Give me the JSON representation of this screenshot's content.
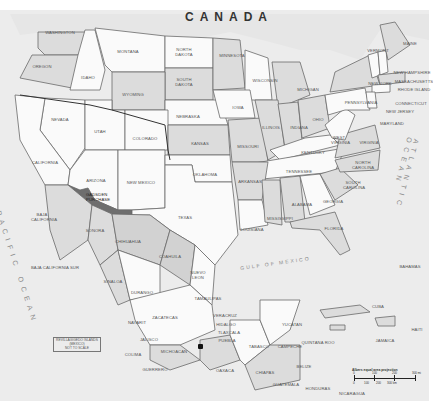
{
  "map": {
    "title_country": "CANADA",
    "highlighted_region": "Gadsden Purchase",
    "oceans": {
      "pacific": "PACIFIC OCEAN",
      "atlantic": "ATLANTIC OCEAN",
      "gulf": "GULF OF MEXICO"
    },
    "us_states": [
      {
        "id": "washington",
        "label": "WASHINGTON"
      },
      {
        "id": "oregon",
        "label": "OREGON"
      },
      {
        "id": "idaho",
        "label": "IDAHO"
      },
      {
        "id": "montana",
        "label": "MONTANA"
      },
      {
        "id": "north-dakota",
        "label": "NORTH DAKOTA"
      },
      {
        "id": "south-dakota",
        "label": "SOUTH DAKOTA"
      },
      {
        "id": "minnesota",
        "label": "MINNESOTA"
      },
      {
        "id": "wisconsin",
        "label": "WISCONSIN"
      },
      {
        "id": "michigan",
        "label": "MICHIGAN"
      },
      {
        "id": "wyoming",
        "label": "WYOMING"
      },
      {
        "id": "nebraska",
        "label": "NEBRASKA"
      },
      {
        "id": "iowa",
        "label": "IOWA"
      },
      {
        "id": "nevada",
        "label": "NEVADA"
      },
      {
        "id": "utah",
        "label": "UTAH"
      },
      {
        "id": "colorado",
        "label": "COLORADO"
      },
      {
        "id": "kansas",
        "label": "KANSAS"
      },
      {
        "id": "california",
        "label": "CALIFORNIA"
      },
      {
        "id": "arizona",
        "label": "ARIZONA"
      },
      {
        "id": "new-mexico",
        "label": "NEW MEXICO"
      },
      {
        "id": "oklahoma",
        "label": "OKLAHOMA"
      },
      {
        "id": "texas",
        "label": "TEXAS"
      },
      {
        "id": "missouri",
        "label": "MISSOURI"
      },
      {
        "id": "illinois",
        "label": "ILLINOIS"
      },
      {
        "id": "indiana",
        "label": "INDIANA"
      },
      {
        "id": "ohio",
        "label": "OHIO"
      },
      {
        "id": "kentucky",
        "label": "KENTUCKY"
      },
      {
        "id": "tennessee",
        "label": "TENNESSEE"
      },
      {
        "id": "arkansas",
        "label": "ARKANSAS"
      },
      {
        "id": "louisiana",
        "label": "LOUISIANA"
      },
      {
        "id": "mississippi",
        "label": "MISSISSIPPI"
      },
      {
        "id": "alabama",
        "label": "ALABAMA"
      },
      {
        "id": "georgia",
        "label": "GEORGIA"
      },
      {
        "id": "florida",
        "label": "FLORIDA"
      },
      {
        "id": "south-carolina",
        "label": "SOUTH CAROLINA"
      },
      {
        "id": "north-carolina",
        "label": "NORTH CAROLINA"
      },
      {
        "id": "virginia",
        "label": "VIRGINIA"
      },
      {
        "id": "west-virginia",
        "label": "WEST VIRGINIA"
      },
      {
        "id": "pennsylvania",
        "label": "PENNSYLVANIA"
      },
      {
        "id": "new-york",
        "label": "NEW YORK"
      },
      {
        "id": "vermont",
        "label": "VERMONT"
      },
      {
        "id": "new-hampshire",
        "label": "NEW HAMPSHIRE"
      },
      {
        "id": "maine",
        "label": "MAINE"
      },
      {
        "id": "massachusetts",
        "label": "MASSACHUSETTS"
      },
      {
        "id": "rhode-island",
        "label": "RHODE ISLAND"
      },
      {
        "id": "connecticut",
        "label": "CONNECTICUT"
      },
      {
        "id": "new-jersey",
        "label": "NEW JERSEY"
      },
      {
        "id": "maryland",
        "label": "MARYLAND"
      },
      {
        "id": "gadsden",
        "label": "GADSDEN PURCHASE"
      }
    ],
    "mexico_states": [
      {
        "id": "baja-california",
        "label": "BAJA CALIFORNIA"
      },
      {
        "id": "baja-california-sur",
        "label": "BAJA CALIFORNIA SUR"
      },
      {
        "id": "sonora",
        "label": "SONORA"
      },
      {
        "id": "chihuahua",
        "label": "CHIHUAHUA"
      },
      {
        "id": "coahuila",
        "label": "COAHUILA"
      },
      {
        "id": "nuevo-leon",
        "label": "NUEVO LEON"
      },
      {
        "id": "sinaloa",
        "label": "SINALOA"
      },
      {
        "id": "durango",
        "label": "DURANGO"
      },
      {
        "id": "tamaulipas",
        "label": "TAMAULIPAS"
      },
      {
        "id": "zacatecas",
        "label": "ZACATECAS"
      },
      {
        "id": "nayarit",
        "label": "NAYARIT"
      },
      {
        "id": "jalisco",
        "label": "JALISCO"
      },
      {
        "id": "colima",
        "label": "COLIMA"
      },
      {
        "id": "michoacan",
        "label": "MICHOACAN"
      },
      {
        "id": "guerrero",
        "label": "GUERRERO"
      },
      {
        "id": "veracruz",
        "label": "VERACRUZ"
      },
      {
        "id": "hidalgo",
        "label": "HIDALGO"
      },
      {
        "id": "tlaxcala",
        "label": "TLAXCALA"
      },
      {
        "id": "puebla",
        "label": "PUEBLA"
      },
      {
        "id": "oaxaca",
        "label": "OAXACA"
      },
      {
        "id": "tabasco",
        "label": "TABASCO"
      },
      {
        "id": "chiapas",
        "label": "CHIAPAS"
      },
      {
        "id": "campeche",
        "label": "CAMPECHE"
      },
      {
        "id": "yucatan",
        "label": "YUCATAN"
      },
      {
        "id": "quintana-roo",
        "label": "QUINTANA ROO"
      }
    ],
    "other_countries": [
      {
        "id": "belize",
        "label": "BELIZE"
      },
      {
        "id": "guatemala",
        "label": "GUATEMALA"
      },
      {
        "id": "honduras",
        "label": "HONDURAS"
      },
      {
        "id": "nicaragua",
        "label": "NICARAGUA"
      },
      {
        "id": "cuba",
        "label": "CUBA"
      },
      {
        "id": "haiti",
        "label": "HAITI"
      },
      {
        "id": "jamaica",
        "label": "JAMAICA"
      },
      {
        "id": "bahamas",
        "label": "BAHAMAS"
      }
    ],
    "inset_box": {
      "line1": "REVILLAGIGEDO ISLANDS",
      "line2": "(MEXICO)",
      "line3": "NOT TO SCALE"
    },
    "scale": {
      "title": "Albers equal area projection",
      "mi_ticks": [
        "0",
        "100",
        "200",
        "300 mi"
      ],
      "km_ticks": [
        "0",
        "100",
        "200",
        "300 km"
      ]
    },
    "capital_marker": "Mexico City"
  }
}
